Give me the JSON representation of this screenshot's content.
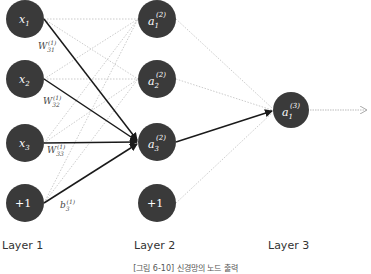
{
  "diagram": {
    "type": "neural-network",
    "layers": [
      {
        "label": "Layer 1",
        "nodes": [
          "x1",
          "x2",
          "x3",
          "+1"
        ]
      },
      {
        "label": "Layer 2",
        "nodes": [
          "a1(2)",
          "a2(2)",
          "a3(2)",
          "+1"
        ]
      },
      {
        "label": "Layer 3",
        "nodes": [
          "a1(3)"
        ]
      }
    ],
    "weight_labels": [
      "W31(1)",
      "W32(1)",
      "W33(1)",
      "b3(1)"
    ],
    "caption": "[그림 6-10] 신경망의 노드 출력",
    "colors": {
      "node": "#3a3a3a",
      "highlight_edge": "#1a1a1a",
      "dotted_edge": "#b0b0b0"
    }
  },
  "labels": {
    "layer1": "Layer 1",
    "layer2": "Layer 2",
    "layer3": "Layer 3",
    "caption": "[그림 6-10] 신경망의 노드 출력"
  }
}
